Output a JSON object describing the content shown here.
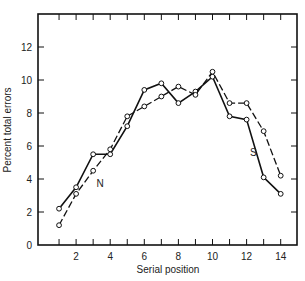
{
  "chart_data": {
    "type": "line",
    "title": "",
    "xlabel": "Serial position",
    "ylabel": "Percent total errors",
    "x": [
      1,
      2,
      3,
      4,
      5,
      6,
      7,
      8,
      9,
      10,
      11,
      12,
      13,
      14
    ],
    "xticks": [
      2,
      4,
      6,
      8,
      10,
      12,
      14
    ],
    "yticks": [
      0,
      2,
      4,
      6,
      8,
      10,
      12
    ],
    "xlim": [
      0,
      15
    ],
    "ylim": [
      0,
      14
    ],
    "grid": false,
    "legend": "inline labels",
    "series": [
      {
        "name": "S",
        "style": "solid",
        "values": [
          2.2,
          3.5,
          5.5,
          5.5,
          7.2,
          9.4,
          9.8,
          8.6,
          9.3,
          10.2,
          7.8,
          7.6,
          4.1,
          3.1
        ]
      },
      {
        "name": "N",
        "style": "dashed",
        "values": [
          1.2,
          3.1,
          4.5,
          5.8,
          7.8,
          8.4,
          9.0,
          9.6,
          9.1,
          10.5,
          8.6,
          8.6,
          6.9,
          4.2
        ]
      }
    ],
    "annotations": [
      {
        "text": "N",
        "x": 3.2,
        "y": 3.5
      },
      {
        "text": "S",
        "x": 12.2,
        "y": 5.4
      }
    ]
  }
}
